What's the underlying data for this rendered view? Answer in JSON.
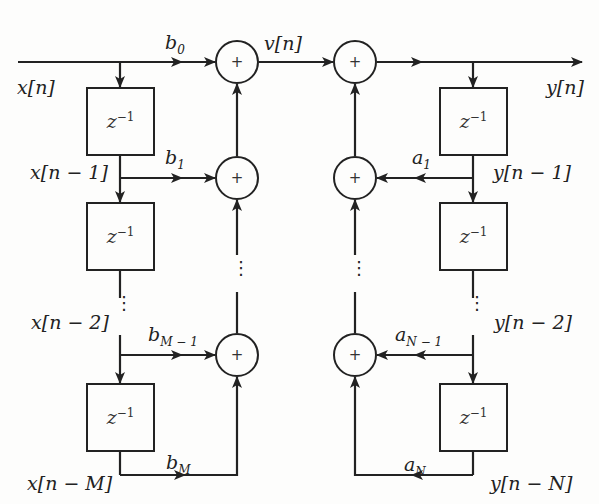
{
  "diagram": {
    "type": "signal-flow-graph",
    "colors": {
      "line": "#222222",
      "background": "#fdfdfc"
    },
    "signals": {
      "input": "x[n]",
      "intermediate": "v[n]",
      "output": "y[n]",
      "x_delays": [
        "x[n − 1]",
        "x[n − 2]",
        "x[n − M]"
      ],
      "y_delays": [
        "y[n − 1]",
        "y[n − 2]",
        "y[n − N]"
      ]
    },
    "delay_block": {
      "base": "z",
      "exponent": "−1"
    },
    "adder_symbol": "+",
    "ellipsis": "⋮",
    "feedforward_coeffs": [
      {
        "base": "b",
        "sub": "0"
      },
      {
        "base": "b",
        "sub": "1"
      },
      {
        "base": "b",
        "sub": "M − 1"
      },
      {
        "base": "b",
        "sub": "M"
      }
    ],
    "feedback_coeffs": [
      {
        "base": "a",
        "sub": "1"
      },
      {
        "base": "a",
        "sub": "N − 1"
      },
      {
        "base": "a",
        "sub": "N"
      }
    ]
  }
}
